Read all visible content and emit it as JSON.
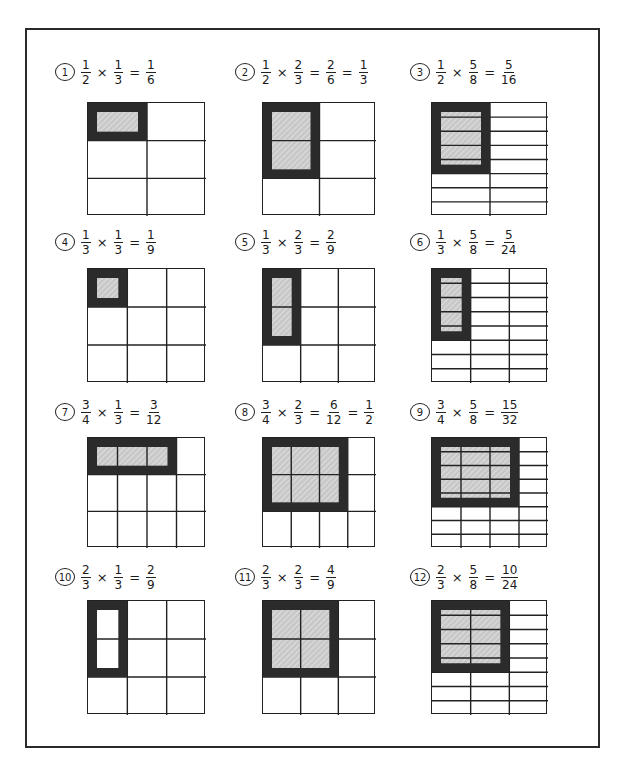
{
  "colors": {
    "line": "#222222",
    "shade": "#c8c8c8",
    "outline": "#2b2b2b"
  },
  "problems": [
    {
      "n": "1",
      "a": {
        "n": "1",
        "d": "2"
      },
      "b": {
        "n": "1",
        "d": "3"
      },
      "results": [
        {
          "n": "1",
          "d": "6"
        }
      ],
      "rows": 2,
      "cols": 1,
      "grid": {
        "rows": 3,
        "cols": 2
      },
      "shade": {
        "rows": 1,
        "cols": 1
      },
      "filled": true
    },
    {
      "n": "2",
      "a": {
        "n": "1",
        "d": "2"
      },
      "b": {
        "n": "2",
        "d": "3"
      },
      "results": [
        {
          "n": "2",
          "d": "6"
        },
        {
          "n": "1",
          "d": "3"
        }
      ],
      "grid": {
        "rows": 3,
        "cols": 2
      },
      "shade": {
        "rows": 2,
        "cols": 1
      },
      "filled": true
    },
    {
      "n": "3",
      "a": {
        "n": "1",
        "d": "2"
      },
      "b": {
        "n": "5",
        "d": "8"
      },
      "results": [
        {
          "n": "5",
          "d": "16"
        }
      ],
      "grid": {
        "rows": 8,
        "cols": 2
      },
      "shade": {
        "rows": 5,
        "cols": 1
      },
      "filled": true
    },
    {
      "n": "4",
      "a": {
        "n": "1",
        "d": "3"
      },
      "b": {
        "n": "1",
        "d": "3"
      },
      "results": [
        {
          "n": "1",
          "d": "9"
        }
      ],
      "grid": {
        "rows": 3,
        "cols": 3
      },
      "shade": {
        "rows": 1,
        "cols": 1
      },
      "filled": true
    },
    {
      "n": "5",
      "a": {
        "n": "1",
        "d": "3"
      },
      "b": {
        "n": "2",
        "d": "3"
      },
      "results": [
        {
          "n": "2",
          "d": "9"
        }
      ],
      "grid": {
        "rows": 3,
        "cols": 3
      },
      "shade": {
        "rows": 2,
        "cols": 1
      },
      "filled": true
    },
    {
      "n": "6",
      "a": {
        "n": "1",
        "d": "3"
      },
      "b": {
        "n": "5",
        "d": "8"
      },
      "results": [
        {
          "n": "5",
          "d": "24"
        }
      ],
      "grid": {
        "rows": 8,
        "cols": 3
      },
      "shade": {
        "rows": 5,
        "cols": 1
      },
      "filled": true
    },
    {
      "n": "7",
      "a": {
        "n": "3",
        "d": "4"
      },
      "b": {
        "n": "1",
        "d": "3"
      },
      "results": [
        {
          "n": "3",
          "d": "12"
        }
      ],
      "grid": {
        "rows": 3,
        "cols": 4
      },
      "shade": {
        "rows": 1,
        "cols": 3
      },
      "filled": true
    },
    {
      "n": "8",
      "a": {
        "n": "3",
        "d": "4"
      },
      "b": {
        "n": "2",
        "d": "3"
      },
      "results": [
        {
          "n": "6",
          "d": "12"
        },
        {
          "n": "1",
          "d": "2"
        }
      ],
      "grid": {
        "rows": 3,
        "cols": 4
      },
      "shade": {
        "rows": 2,
        "cols": 3
      },
      "filled": true
    },
    {
      "n": "9",
      "a": {
        "n": "3",
        "d": "4"
      },
      "b": {
        "n": "5",
        "d": "8"
      },
      "results": [
        {
          "n": "15",
          "d": "32"
        }
      ],
      "grid": {
        "rows": 8,
        "cols": 4
      },
      "shade": {
        "rows": 5,
        "cols": 3
      },
      "filled": true
    },
    {
      "n": "10",
      "a": {
        "n": "2",
        "d": "3"
      },
      "b": {
        "n": "1",
        "d": "3"
      },
      "results": [
        {
          "n": "2",
          "d": "9"
        }
      ],
      "grid": {
        "rows": 3,
        "cols": 3
      },
      "shade": {
        "rows": 2,
        "cols": 1
      },
      "filled": false
    },
    {
      "n": "11",
      "a": {
        "n": "2",
        "d": "3"
      },
      "b": {
        "n": "2",
        "d": "3"
      },
      "results": [
        {
          "n": "4",
          "d": "9"
        }
      ],
      "grid": {
        "rows": 3,
        "cols": 3
      },
      "shade": {
        "rows": 2,
        "cols": 2
      },
      "filled": true
    },
    {
      "n": "12",
      "a": {
        "n": "2",
        "d": "3"
      },
      "b": {
        "n": "5",
        "d": "8"
      },
      "results": [
        {
          "n": "10",
          "d": "24"
        }
      ],
      "grid": {
        "rows": 8,
        "cols": 3
      },
      "shade": {
        "rows": 5,
        "cols": 2
      },
      "filled": true
    }
  ]
}
